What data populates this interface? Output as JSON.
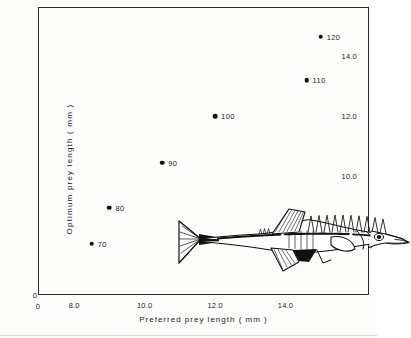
{
  "figure": {
    "illustration": "three-spined-stickleback-fish"
  },
  "chart_data": {
    "type": "scatter",
    "title": "",
    "xlabel": "Preferred  prey  length ( mm )",
    "ylabel": "Optimum  prey  length  ( mm )",
    "xlim": [
      7.0,
      16.4
    ],
    "ylim": [
      6.0,
      15.6
    ],
    "grid": false,
    "legend": null,
    "x_origin_label": "0",
    "y_origin_label": "0",
    "xticks_major": [
      8.0,
      10.0,
      12.0,
      14.0
    ],
    "xticklabels": [
      "8.0",
      "10.0",
      "12.0",
      "14.0"
    ],
    "xticks_minor": [
      7.5,
      8.5,
      9.0,
      9.5,
      10.5,
      11.0,
      11.5,
      12.5,
      13.0,
      13.5,
      14.5,
      15.0,
      15.5,
      16.0
    ],
    "yticks_major": [
      8.0,
      10.0,
      12.0,
      14.0
    ],
    "yticklabels": [
      "8.0",
      "10.0",
      "12.0",
      "14.0"
    ],
    "yticks_minor": [
      7.0,
      9.0,
      11.0,
      13.0,
      15.0
    ],
    "point_labels": [
      "70",
      "80",
      "90",
      "100",
      "110",
      "120"
    ],
    "x": [
      8.5,
      9.0,
      10.5,
      12.0,
      14.6,
      15.0
    ],
    "y": [
      7.75,
      8.95,
      10.45,
      12.0,
      13.2,
      14.65
    ],
    "points": [
      {
        "label": "70",
        "x": 8.5,
        "y": 7.75
      },
      {
        "label": "80",
        "x": 9.0,
        "y": 8.95
      },
      {
        "label": "90",
        "x": 10.5,
        "y": 10.45
      },
      {
        "label": "100",
        "x": 12.0,
        "y": 12.0
      },
      {
        "label": "110",
        "x": 14.6,
        "y": 13.2
      },
      {
        "label": "120",
        "x": 15.0,
        "y": 14.65
      }
    ],
    "marker_color": "#111111",
    "axis_color": "#2b2b2b"
  }
}
